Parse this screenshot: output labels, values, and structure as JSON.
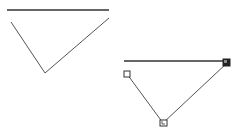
{
  "canvas": {
    "width": 243,
    "height": 135,
    "background": "#ffffff"
  },
  "colors": {
    "stroke": "#444444",
    "handle_fill": "#ffffff",
    "handle_stroke": "#333333",
    "active_handle_fill": "#222222"
  },
  "shapes": [
    {
      "id": "unselected-shape",
      "selected": false,
      "baseline": {
        "x1": 7,
        "y1": 10,
        "x2": 109,
        "y2": 10
      },
      "polyline": [
        [
          11,
          22
        ],
        [
          45,
          73
        ],
        [
          109,
          18
        ]
      ]
    },
    {
      "id": "selected-shape",
      "selected": true,
      "baseline": {
        "x1": 124,
        "y1": 61,
        "x2": 226,
        "y2": 61
      },
      "polyline": [
        [
          127,
          74
        ],
        [
          163,
          123
        ],
        [
          227,
          63
        ]
      ],
      "handles": [
        {
          "name": "start-handle",
          "x": 127,
          "y": 74,
          "style": "hollow"
        },
        {
          "name": "vertex-handle",
          "x": 163,
          "y": 123,
          "style": "hollow-nested"
        },
        {
          "name": "end-handle",
          "x": 227,
          "y": 63,
          "style": "filled"
        }
      ]
    }
  ]
}
